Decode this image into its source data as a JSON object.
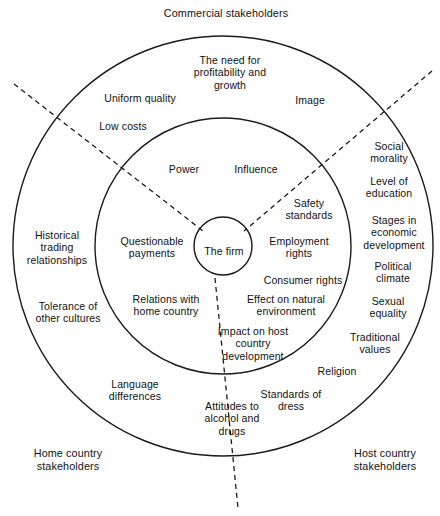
{
  "diagram": {
    "geometry": {
      "center_x": 223,
      "center_y": 246,
      "outer_radius": 210,
      "middle_radius": 128,
      "inner_radius": 29,
      "stroke_color": "#1a1a1a",
      "background": "#ffffff"
    },
    "corner_labels": [
      {
        "name": "commercial-stakeholders",
        "text": "Commercial stakeholders",
        "x": 226,
        "y": 13
      },
      {
        "name": "home-country-stakeholders",
        "text": "Home country\nstakeholders",
        "x": 68,
        "y": 460
      },
      {
        "name": "host-country-stakeholders",
        "text": "Host country\nstakeholders",
        "x": 385,
        "y": 460
      }
    ],
    "core": {
      "name": "the-firm",
      "text": "The firm",
      "x": 224,
      "y": 251
    },
    "inner_ring_labels": [
      {
        "name": "power",
        "text": "Power",
        "x": 184,
        "y": 169
      },
      {
        "name": "influence",
        "text": "Influence",
        "x": 256,
        "y": 169
      },
      {
        "name": "questionable-payments",
        "text": "Questionable\npayments",
        "x": 152,
        "y": 247
      },
      {
        "name": "relations-with-home-country",
        "text": "Relations with\nhome country",
        "x": 166,
        "y": 305
      },
      {
        "name": "safety-standards",
        "text": "Safety\nstandards",
        "x": 309,
        "y": 209
      },
      {
        "name": "employment-rights",
        "text": "Employment\nrights",
        "x": 299,
        "y": 247
      },
      {
        "name": "consumer-rights",
        "text": "Consumer rights",
        "x": 303,
        "y": 280
      },
      {
        "name": "effect-on-natural-environment",
        "text": "Effect on natural\nenvironment",
        "x": 286,
        "y": 305
      },
      {
        "name": "impact-on-host-country-development",
        "text": "Impact on host\ncountry\ndevelopment",
        "x": 253,
        "y": 343
      }
    ],
    "outer_ring_labels": [
      {
        "name": "the-need-for-profitability-and-growth",
        "text": "The need for\nprofitability and\ngrowth",
        "x": 230,
        "y": 72
      },
      {
        "name": "uniform-quality",
        "text": "Uniform quality",
        "x": 140,
        "y": 98
      },
      {
        "name": "image",
        "text": "Image",
        "x": 310,
        "y": 100
      },
      {
        "name": "low-costs",
        "text": "Low costs",
        "x": 123,
        "y": 126
      },
      {
        "name": "social-morality",
        "text": "Social\nmorality",
        "x": 389,
        "y": 152
      },
      {
        "name": "level-of-education",
        "text": "Level of\neducation",
        "x": 389,
        "y": 187
      },
      {
        "name": "stages-in-economic-development",
        "text": "Stages in\neconomic\ndevelopment",
        "x": 394,
        "y": 232
      },
      {
        "name": "political-climate",
        "text": "Political\nclimate",
        "x": 393,
        "y": 272
      },
      {
        "name": "sexual-equality",
        "text": "Sexual\nequality",
        "x": 388,
        "y": 307
      },
      {
        "name": "traditional-values",
        "text": "Traditional\nvalues",
        "x": 375,
        "y": 343
      },
      {
        "name": "religion",
        "text": "Religion",
        "x": 337,
        "y": 371
      },
      {
        "name": "standards-of-dress",
        "text": "Standards of\ndress",
        "x": 291,
        "y": 400
      },
      {
        "name": "attitudes-to-alcohol-and-drugs",
        "text": "Attitudes to\nalcohol and\ndrugs",
        "x": 232,
        "y": 418
      },
      {
        "name": "language-differences",
        "text": "Language\ndifferences",
        "x": 135,
        "y": 390
      },
      {
        "name": "tolerance-of-other-cultures",
        "text": "Tolerance of\nother cultures",
        "x": 68,
        "y": 312
      },
      {
        "name": "historical-trading-relationships",
        "text": "Historical\ntrading\nrelationships",
        "x": 57,
        "y": 247
      }
    ],
    "divider_lines": [
      {
        "name": "divider-upper-left",
        "x1": 14,
        "y1": 84,
        "x2": 203,
        "y2": 231
      },
      {
        "name": "divider-upper-right",
        "x1": 432,
        "y1": 71,
        "x2": 244,
        "y2": 231
      },
      {
        "name": "divider-bottom",
        "x1": 215,
        "y1": 278,
        "x2": 238,
        "y2": 508
      }
    ]
  }
}
